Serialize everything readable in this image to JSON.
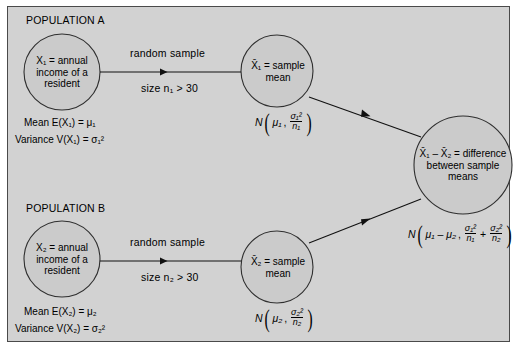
{
  "figure": {
    "type": "statistical-flow-diagram",
    "background_color": "#d2d2d2",
    "border_color": "#4a4a4a"
  },
  "population_a": {
    "heading": "POPULATION A",
    "variable_circle": {
      "line1": "X₁ = annual",
      "line2": "income of a",
      "line3": "resident"
    },
    "mean_label": "Mean E(X₁) = μ₁",
    "variance_label": "Variance V(X₁) = σ₁²",
    "arrow_label_top": "random sample",
    "arrow_label_bottom": "size n₁ > 30",
    "sample_circle": {
      "line1": "X̄₁ = sample",
      "line2": "mean"
    },
    "distribution": {
      "symbol": "N",
      "mean": "μ₁",
      "var_num": "σ₁²",
      "var_den": "n₁"
    }
  },
  "population_b": {
    "heading": "POPULATION B",
    "variable_circle": {
      "line1": "X₂ = annual",
      "line2": "income of a",
      "line3": "resident"
    },
    "mean_label": "Mean E(X₂) = μ₂",
    "variance_label": "Variance V(X₂) = σ₂²",
    "arrow_label_top": "random sample",
    "arrow_label_bottom": "size n₂ > 30",
    "sample_circle": {
      "line1": "X̄₂ = sample",
      "line2": "mean"
    },
    "distribution": {
      "symbol": "N",
      "mean": "μ₂",
      "var_num": "σ₂²",
      "var_den": "n₂"
    }
  },
  "difference": {
    "circle": {
      "line1": "X̄₁ – X̄₂ = difference",
      "line2": "between sample",
      "line3": "means"
    },
    "distribution": {
      "symbol": "N",
      "mean": "μ₁ – μ₂",
      "term1_num": "σ₁²",
      "term1_den": "n₁",
      "operator": "+",
      "term2_num": "σ₂²",
      "term2_den": "n₂"
    }
  }
}
